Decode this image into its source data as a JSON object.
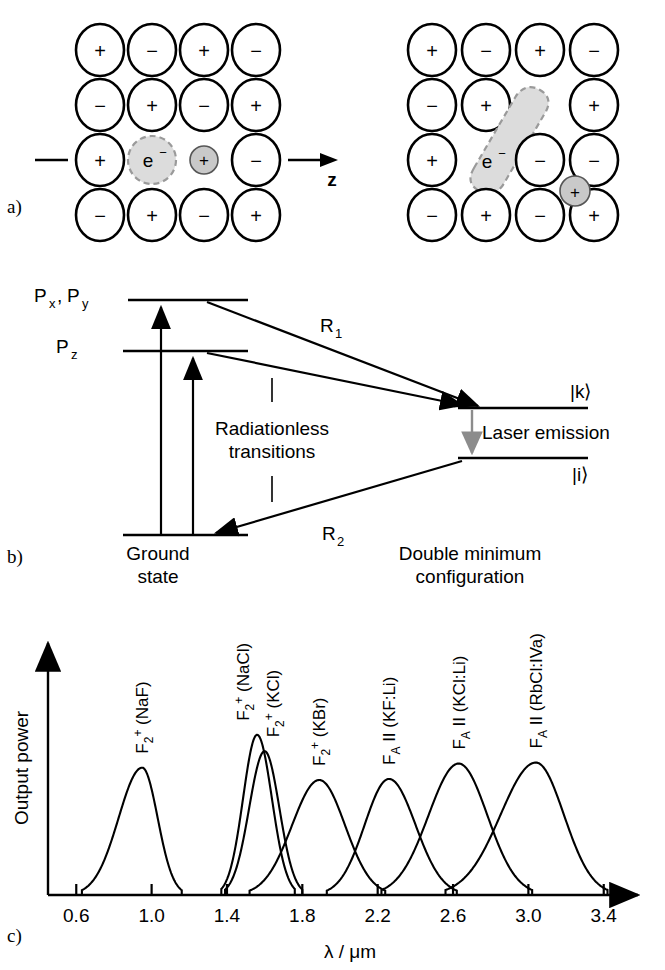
{
  "figure": {
    "panel_tags": {
      "a": "a)",
      "b": "b)",
      "c": "c)"
    }
  },
  "panel_a": {
    "name": "color-centre-lattice-diagram",
    "axis_label": "z",
    "electron_label": "e",
    "electron_charge": "−",
    "vacancy_label": "+",
    "left_lattice": {
      "caption": "F2+ centre at rest",
      "rows": [
        [
          "+",
          "−",
          "+",
          "−"
        ],
        [
          "−",
          "+",
          "−",
          "+"
        ],
        [
          "+",
          "e−",
          "+small",
          "−"
        ],
        [
          "−",
          "+",
          "−",
          "+"
        ]
      ]
    },
    "right_lattice": {
      "caption": "relaxed double minimum configuration",
      "rows": [
        [
          "+",
          "−",
          "+",
          "−"
        ],
        [
          "−",
          "+",
          "blob",
          "+"
        ],
        [
          "+",
          "e−",
          "−",
          "−"
        ],
        [
          "−",
          "+",
          "−",
          "+"
        ]
      ]
    }
  },
  "panel_b": {
    "name": "energy-level-diagram",
    "levels": [
      {
        "id": "pxpy",
        "label_main": "P",
        "label_sub": "x, y",
        "label_full": "P x , P y"
      },
      {
        "id": "pz",
        "label_main": "P",
        "label_sub": "z",
        "label_full": "P z"
      },
      {
        "id": "ground",
        "label": "Ground\nstate",
        "line1": "Ground",
        "line2": "state"
      },
      {
        "id": "k",
        "label": "|k⟩"
      },
      {
        "id": "i",
        "label": "|i⟩"
      }
    ],
    "transitions": [
      {
        "id": "r1",
        "label_main": "R",
        "label_sub": "1"
      },
      {
        "id": "r2",
        "label_main": "R",
        "label_sub": "2"
      }
    ],
    "annotations": {
      "radiationless_line1": "Radiationless",
      "radiationless_line2": "transitions",
      "laser_emission": "Laser emission",
      "right_caption_line1": "Double minimum",
      "right_caption_line2": "configuration"
    },
    "colors": {
      "laser_arrow": "#8c8c8c",
      "lines": "#000000"
    }
  },
  "panel_c": {
    "name": "colour-centre-laser-tuning-ranges",
    "axis": {
      "ylabel": "Output power",
      "xlabel_lambda": "λ",
      "xlabel_slash": " / ",
      "xlabel_unit": "μm",
      "xlabel_full": "λ / μm"
    }
  },
  "chart_data": {
    "type": "line",
    "title": "",
    "xlabel": "λ / μm",
    "ylabel": "Output power",
    "xlim": [
      0.45,
      3.55
    ],
    "ylim": [
      0,
      1.12
    ],
    "grid": false,
    "legend": "inline-labels-above-peaks",
    "xticks": [
      0.6,
      1.0,
      1.4,
      1.8,
      2.2,
      2.6,
      3.0,
      3.4
    ],
    "xticklabels": [
      "0.6",
      "1.0",
      "1.4",
      "1.8",
      "2.2",
      "2.6",
      "3.0",
      "3.4"
    ],
    "yticks": [],
    "yticklabels": [],
    "series": [
      {
        "name": "F2+ (NaF)",
        "label_base": "F",
        "label_sub": "2",
        "label_sup": "+",
        "label_host": "(NaF)",
        "peak_x": 0.95,
        "peak_y": 0.62,
        "range_start": 0.63,
        "range_end": 1.16,
        "width": 0.12
      },
      {
        "name": "F2+ (NaCl)",
        "label_base": "F",
        "label_sub": "2",
        "label_sup": "+",
        "label_host": "(NaCl)",
        "peak_x": 1.56,
        "peak_y": 0.78,
        "range_start": 1.37,
        "range_end": 1.76,
        "width": 0.115
      },
      {
        "name": "F2+ (KCl)",
        "label_base": "F",
        "label_sub": "2",
        "label_sup": "+",
        "label_host": "(KCl)",
        "peak_x": 1.6,
        "peak_y": 0.7,
        "range_start": 1.39,
        "range_end": 1.8,
        "width": 0.12
      },
      {
        "name": "F2+ (KBr)",
        "label_base": "F",
        "label_sub": "2",
        "label_sup": "+",
        "label_host": "(KBr)",
        "peak_x": 1.89,
        "peak_y": 0.56,
        "range_start": 1.52,
        "range_end": 2.24,
        "width": 0.17
      },
      {
        "name": "FA II (KF:Li)",
        "label_base": "F",
        "label_sub": "A",
        "label_roman": "II",
        "label_host": "(KF:Li)",
        "peak_x": 2.26,
        "peak_y": 0.565,
        "range_start": 1.93,
        "range_end": 2.62,
        "width": 0.175
      },
      {
        "name": "FA II (KCl:Li)",
        "label_base": "F",
        "label_sub": "A",
        "label_roman": "II",
        "label_host": "(KCl:Li)",
        "peak_x": 2.63,
        "peak_y": 0.64,
        "range_start": 2.22,
        "range_end": 3.02,
        "width": 0.195
      },
      {
        "name": "FA II (RbCl:IVa)",
        "label_base": "F",
        "label_sub": "A",
        "label_roman": "II",
        "label_host": "(RbCl:IVa)",
        "peak_x": 3.04,
        "peak_y": 0.645,
        "range_start": 2.56,
        "range_end": 3.42,
        "width": 0.215
      }
    ]
  }
}
